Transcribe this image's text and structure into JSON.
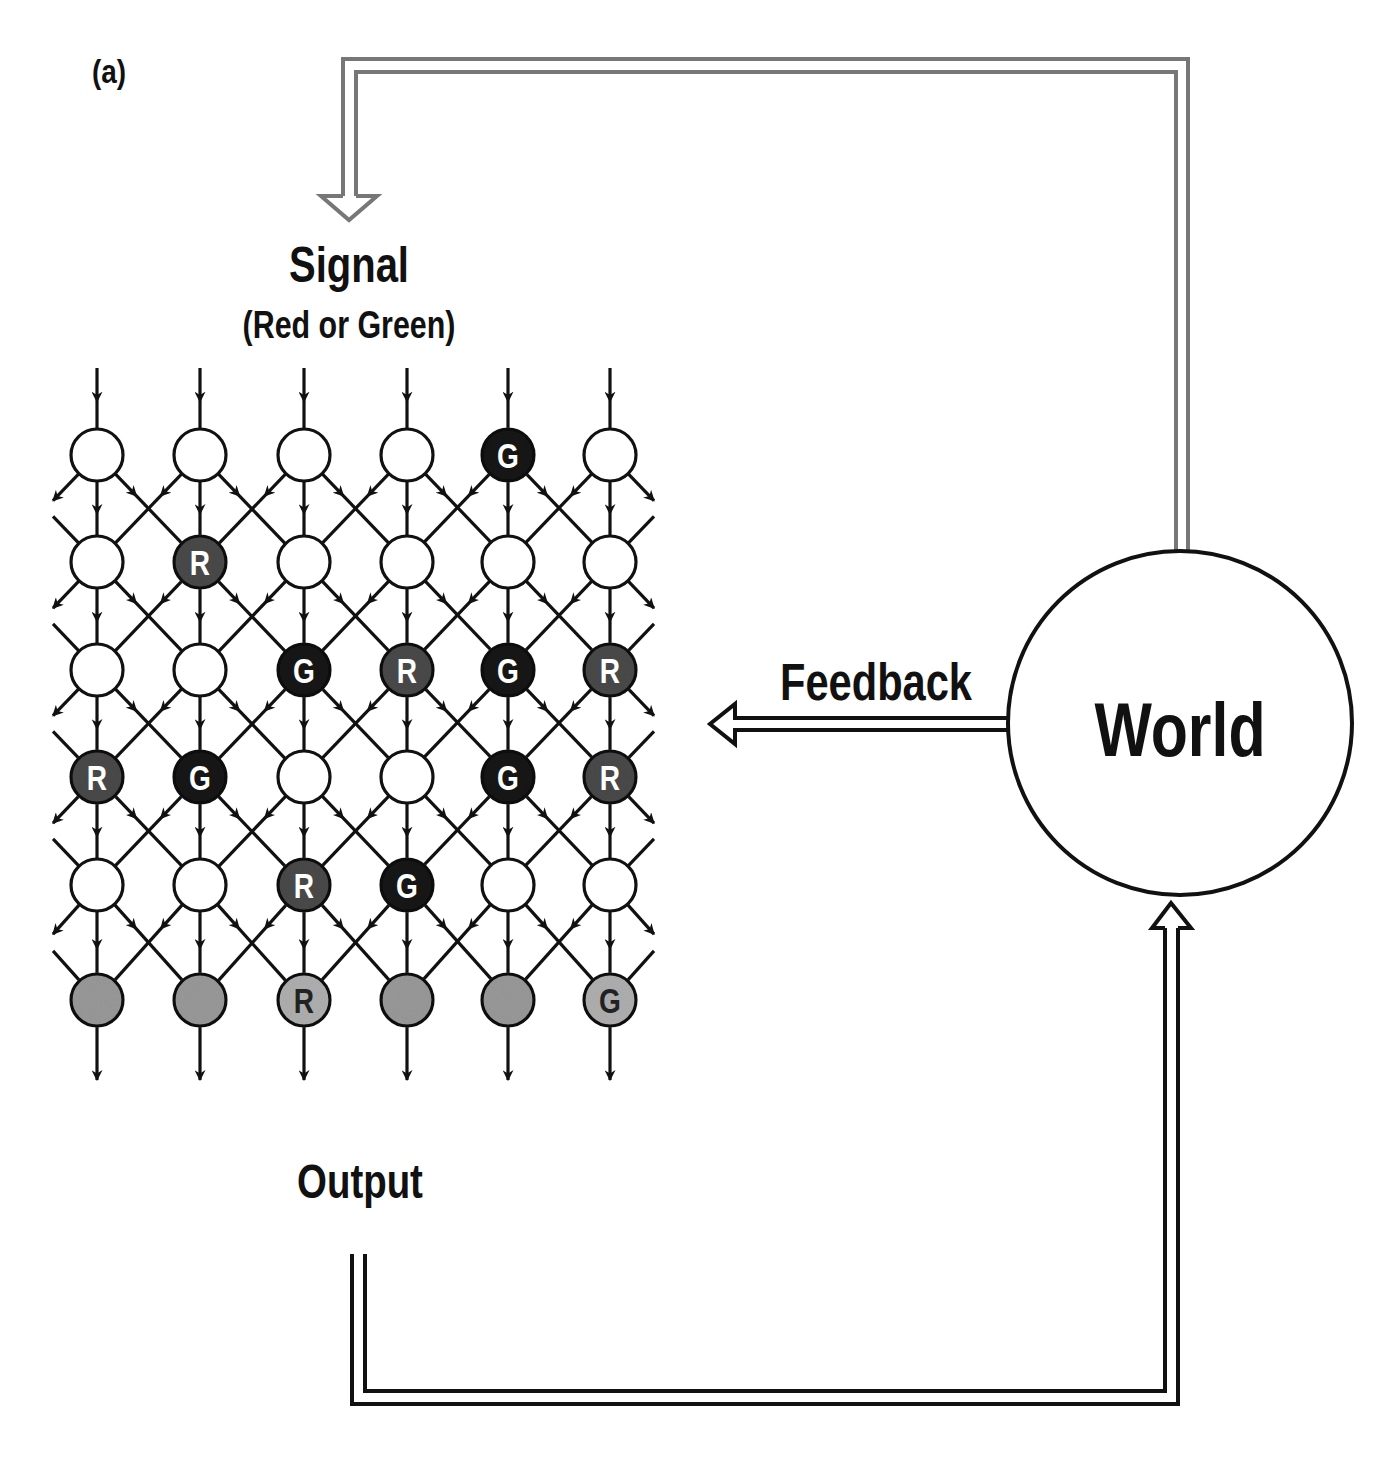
{
  "figure": {
    "panel_label": "(a)",
    "signal": {
      "title": "Signal",
      "subtitle": "(Red or Green)"
    },
    "feedback_label": "Feedback",
    "world_label": "World",
    "output_label": "Output"
  },
  "grid": {
    "columns_x": [
      97,
      200,
      304,
      407,
      508,
      610
    ],
    "rows_y": [
      455,
      562,
      670,
      777,
      885,
      1000
    ],
    "node_radius": 26,
    "rows": [
      [
        "",
        "",
        "",
        "",
        "G",
        ""
      ],
      [
        "",
        "R",
        "",
        "",
        "",
        ""
      ],
      [
        "",
        "",
        "G",
        "R",
        "G",
        "R"
      ],
      [
        "R",
        "G",
        "",
        "",
        "G",
        "R"
      ],
      [
        "",
        "",
        "R",
        "G",
        "",
        ""
      ],
      [
        "",
        "",
        "R",
        "",
        "",
        "G"
      ]
    ],
    "output_row_index": 5
  },
  "colors": {
    "ink": "#111111",
    "green_node": "#151515",
    "red_node": "#4a4a4a",
    "empty_node": "#ffffff",
    "output_node": "#9a9a9a",
    "output_node_marked": "#b0b0b0",
    "signal_path": "#777777",
    "node_letter_light": "#ffffff",
    "node_letter_dark": "#222222"
  }
}
